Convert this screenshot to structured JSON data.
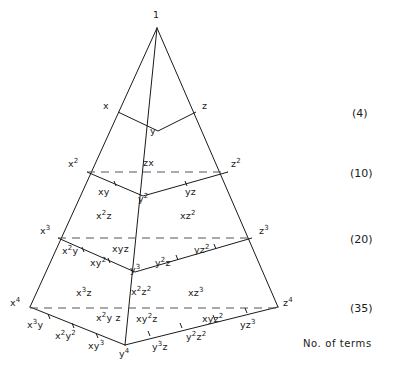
{
  "figure": {
    "caption": "No. of terms",
    "apex_label": "1",
    "stroke_color": "#1a1a1a",
    "dash_color": "#555555",
    "background": "#ffffff"
  },
  "counts": [
    {
      "text": "(4)",
      "x": 352,
      "y": 108
    },
    {
      "text": "(10)",
      "x": 350,
      "y": 168
    },
    {
      "text": "(20)",
      "x": 350,
      "y": 234
    },
    {
      "text": "(35)",
      "x": 350,
      "y": 303
    }
  ],
  "caption_pos": {
    "x": 303,
    "y": 338
  },
  "labels": [
    {
      "base": "1",
      "sup": "",
      "x": 153,
      "y": 10,
      "name": "term-1"
    },
    {
      "base": "x",
      "sup": "",
      "x": 103,
      "y": 101,
      "name": "term-x"
    },
    {
      "base": "z",
      "sup": "",
      "x": 202,
      "y": 101,
      "name": "term-z"
    },
    {
      "base": "y",
      "sup": "",
      "x": 150,
      "y": 126,
      "name": "term-y"
    },
    {
      "base": "x",
      "sup": "2",
      "x": 68,
      "y": 159,
      "name": "term-x2"
    },
    {
      "base": "zx",
      "sup": "",
      "x": 143,
      "y": 158,
      "name": "term-zx"
    },
    {
      "base": "z",
      "sup": "2",
      "x": 231,
      "y": 159,
      "name": "term-z2"
    },
    {
      "base": "xy",
      "sup": "",
      "x": 98,
      "y": 187,
      "name": "term-xy"
    },
    {
      "base": "y",
      "sup": "2",
      "x": 138,
      "y": 194,
      "name": "term-y2"
    },
    {
      "base": "yz",
      "sup": "",
      "x": 185,
      "y": 187,
      "name": "term-yz"
    },
    {
      "base": "x",
      "sup": "3",
      "x": 40,
      "y": 226,
      "name": "term-x3"
    },
    {
      "base": "x",
      "sup": "2",
      "x": 96,
      "y": 211,
      "name": "term-x2z",
      "tail": "z"
    },
    {
      "base": "xz",
      "sup": "2",
      "x": 180,
      "y": 211,
      "name": "term-xz2"
    },
    {
      "base": "z",
      "sup": "3",
      "x": 259,
      "y": 226,
      "name": "term-z3"
    },
    {
      "base": "x",
      "sup": "2",
      "x": 62,
      "y": 246,
      "name": "term-x2y",
      "tail": "y"
    },
    {
      "base": "xy",
      "sup": "2",
      "x": 90,
      "y": 258,
      "name": "term-xy2"
    },
    {
      "base": "xyz",
      "sup": "",
      "x": 112,
      "y": 244,
      "name": "term-xyz"
    },
    {
      "base": "y",
      "sup": "3",
      "x": 130,
      "y": 265,
      "name": "term-y3"
    },
    {
      "base": "y",
      "sup": "2",
      "x": 155,
      "y": 258,
      "name": "term-y2z",
      "tail": "z"
    },
    {
      "base": "yz",
      "sup": "2",
      "x": 194,
      "y": 245,
      "name": "term-yz2"
    },
    {
      "base": "x",
      "sup": "4",
      "x": 10,
      "y": 298,
      "name": "term-x4"
    },
    {
      "base": "x",
      "sup": "3",
      "x": 76,
      "y": 288,
      "name": "term-x3z",
      "tail": "z"
    },
    {
      "base": "x",
      "sup": "2",
      "x": 131,
      "y": 287,
      "name": "term-x2z2",
      "tail2": "2"
    },
    {
      "base": "xz",
      "sup": "3",
      "x": 188,
      "y": 288,
      "name": "term-xz3"
    },
    {
      "base": "z",
      "sup": "4",
      "x": 283,
      "y": 298,
      "name": "term-z4"
    },
    {
      "base": "x",
      "sup": "3",
      "x": 27,
      "y": 320,
      "name": "term-x3y",
      "tail": "y"
    },
    {
      "base": "x",
      "sup": "2",
      "x": 55,
      "y": 331,
      "name": "term-x2y2",
      "tail2y": "2"
    },
    {
      "base": "xy",
      "sup": "3",
      "x": 88,
      "y": 341,
      "name": "term-xy3"
    },
    {
      "base": "x",
      "sup": "2",
      "x": 96,
      "y": 313,
      "name": "term-x2yz",
      "tail": "y z"
    },
    {
      "base": "xy",
      "sup": "2",
      "x": 136,
      "y": 314,
      "name": "term-xy2z",
      "tail": "z"
    },
    {
      "base": "y",
      "sup": "4",
      "x": 119,
      "y": 349,
      "name": "term-y4"
    },
    {
      "base": "y",
      "sup": "3",
      "x": 152,
      "y": 342,
      "name": "term-y3z",
      "tail": "z"
    },
    {
      "base": "y",
      "sup": "2",
      "x": 186,
      "y": 332,
      "name": "term-y2z2",
      "tail2": "2"
    },
    {
      "base": "xyz",
      "sup": "2",
      "x": 202,
      "y": 314,
      "name": "term-xyz2"
    },
    {
      "base": "yz",
      "sup": "3",
      "x": 240,
      "y": 320,
      "name": "term-yz3"
    }
  ],
  "geometry": {
    "apex": {
      "x": 157,
      "y": 28
    },
    "base_left": {
      "x": 30,
      "y": 307
    },
    "base_right": {
      "x": 278,
      "y": 307
    },
    "base_front": {
      "x": 125,
      "y": 345
    },
    "solid_edges": [
      "157,28 30,307",
      "157,28 278,307",
      "157,28 125,345",
      "30,307 125,345",
      "125,345 278,307",
      "118,112 158,131",
      "158,131 196,112",
      "87,172 143,196",
      "143,196 228,172",
      "58,238 135,272",
      "135,272 252,238",
      "30,307 125,345",
      "125,345 278,307"
    ],
    "dashed_levels": [
      {
        "x1": 87,
        "y1": 172,
        "x2": 228,
        "y2": 172
      },
      {
        "x1": 58,
        "y1": 238,
        "x2": 252,
        "y2": 238
      },
      {
        "x1": 30,
        "y1": 308,
        "x2": 278,
        "y2": 308
      }
    ]
  }
}
